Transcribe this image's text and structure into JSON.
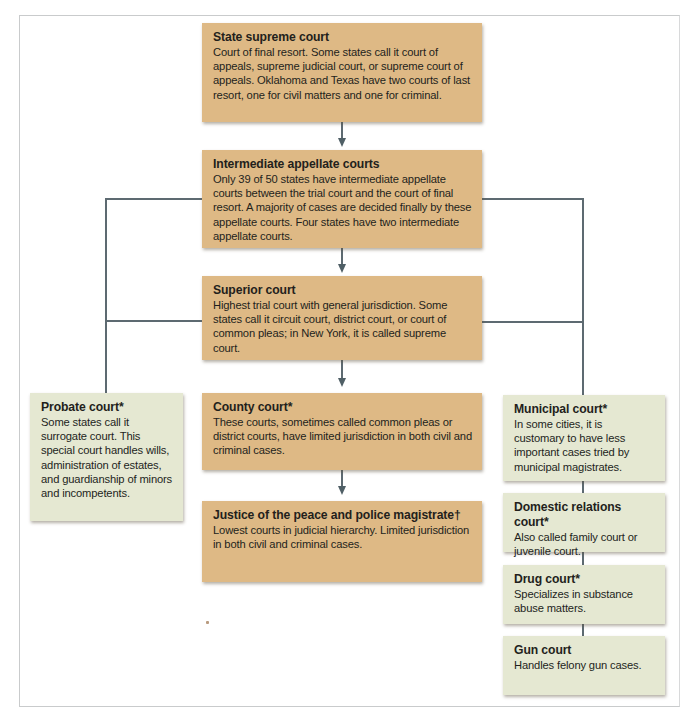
{
  "diagram": {
    "type": "flowchart",
    "colors": {
      "main_box": "#deb985",
      "side_box": "#e5e8d2",
      "connector": "#5d6a71"
    },
    "main_column": [
      {
        "title": "State supreme court",
        "description": "Court of final resort. Some states call it court of appeals, supreme judicial court, or supreme court of appeals. Oklahoma and Texas have two courts of last resort, one for civil matters and one for criminal."
      },
      {
        "title": "Intermediate appellate courts",
        "description": "Only 39 of 50 states have intermediate appellate courts between the trial court and the court of final resort. A majority of cases are decided finally by these appellate courts. Four states have two intermediate appellate courts."
      },
      {
        "title": "Superior court",
        "description": "Highest trial court with general jurisdiction. Some states call it circuit court, district court, or court of common pleas; in New York, it is called supreme court."
      },
      {
        "title": "County court*",
        "description": "These courts, sometimes called common pleas or district courts, have limited jurisdiction in both civil and criminal cases."
      },
      {
        "title": "Justice of the peace and police magistrate†",
        "description": "Lowest courts in judicial hierarchy. Limited jurisdiction in both civil and criminal cases."
      }
    ],
    "left_column": [
      {
        "title": "Probate court*",
        "description": "Some states call it surrogate court. This special court handles wills, administration of estates, and guardianship of minors and incompetents."
      }
    ],
    "right_column": [
      {
        "title": "Municipal court*",
        "description": "In some cities, it is customary to have less important cases tried by municipal magistrates."
      },
      {
        "title": "Domestic relations court*",
        "description": "Also called family court or juvenile court."
      },
      {
        "title": "Drug court*",
        "description": "Specializes in substance abuse matters."
      },
      {
        "title": "Gun court",
        "description": "Handles felony gun cases."
      }
    ]
  }
}
